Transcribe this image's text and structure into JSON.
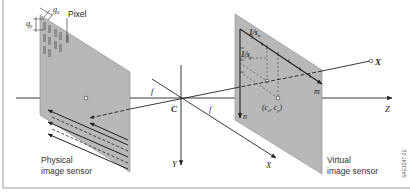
{
  "diagram": {
    "colors": {
      "sensor_fill": "#b8b8b8",
      "sensor_edge": "#6e6e6e",
      "line": "#222222",
      "pixel": "#8a8a8a",
      "border": "#9a9a9a"
    },
    "labels": {
      "pixel": "Pixel",
      "qx": "q",
      "qx_sub": "x",
      "qy": "q",
      "qy_sub": "y",
      "physical_line1": "Physical",
      "physical_line2": "image sensor",
      "virtual_line1": "Virtual",
      "virtual_line2": "image sensor",
      "center": "C",
      "f_left": "f",
      "f_right": "f",
      "axis_y": "Y",
      "axis_x": "X",
      "axis_z": "Z",
      "point_x": "X",
      "axis_m": "m",
      "axis_n": "n",
      "sx": "1/s",
      "sx_sub": "x",
      "sy": "1/s",
      "sy_sub": "y",
      "principal_point": "(c",
      "cx_sub": "x",
      "comma": ", c",
      "cy_sub": "y",
      "close_paren": ")",
      "figure_code": "SAE1247-2E"
    }
  }
}
